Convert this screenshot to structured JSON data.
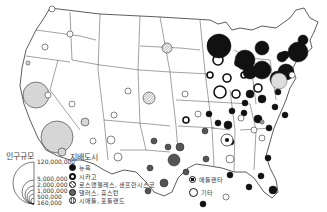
{
  "map": {
    "land_color": "#ffffff",
    "border_color": "#333333",
    "cities": [
      {
        "x": 167,
        "y": 48,
        "r": 5,
        "type": "seattle_portland"
      },
      {
        "x": 149,
        "y": 98,
        "r": 6,
        "type": "seattle_portland"
      },
      {
        "x": 52,
        "y": 9,
        "r": 3,
        "type": "other"
      },
      {
        "x": 45,
        "y": 47,
        "r": 3,
        "type": "other"
      },
      {
        "x": 70,
        "y": 34,
        "r": 3,
        "type": "other"
      },
      {
        "x": 28,
        "y": 63,
        "r": 2,
        "type": "seattle_portland"
      },
      {
        "x": 36,
        "y": 95,
        "r": 13,
        "type": "la_sf"
      },
      {
        "x": 57,
        "y": 137,
        "r": 16,
        "type": "la_sf"
      },
      {
        "x": 62,
        "y": 152,
        "r": 4,
        "type": "la_sf"
      },
      {
        "x": 48,
        "y": 95,
        "r": 3,
        "type": "other"
      },
      {
        "x": 72,
        "y": 104,
        "r": 3,
        "type": "other"
      },
      {
        "x": 85,
        "y": 122,
        "r": 4,
        "type": "la_sf"
      },
      {
        "x": 93,
        "y": 141,
        "r": 3,
        "type": "other"
      },
      {
        "x": 128,
        "y": 91,
        "r": 3,
        "type": "other"
      },
      {
        "x": 114,
        "y": 115,
        "r": 3,
        "type": "other"
      },
      {
        "x": 111,
        "y": 140,
        "r": 4,
        "type": "other"
      },
      {
        "x": 118,
        "y": 157,
        "r": 4,
        "type": "other"
      },
      {
        "x": 185,
        "y": 94,
        "r": 3,
        "type": "other"
      },
      {
        "x": 186,
        "y": 120,
        "r": 3,
        "type": "chicago"
      },
      {
        "x": 198,
        "y": 114,
        "r": 3,
        "type": "other"
      },
      {
        "x": 214,
        "y": 44,
        "r": 6,
        "type": "chicago"
      },
      {
        "x": 220,
        "y": 92,
        "r": 6,
        "type": "chicago"
      },
      {
        "x": 236,
        "y": 94,
        "r": 4,
        "type": "chicago"
      },
      {
        "x": 258,
        "y": 88,
        "r": 4,
        "type": "chicago"
      },
      {
        "x": 227,
        "y": 78,
        "r": 4,
        "type": "chicago"
      },
      {
        "x": 210,
        "y": 75,
        "r": 3,
        "type": "chicago"
      },
      {
        "x": 244,
        "y": 75,
        "r": 3,
        "type": "chicago"
      },
      {
        "x": 218,
        "y": 60,
        "r": 5,
        "type": "chicago"
      },
      {
        "x": 238,
        "y": 63,
        "r": 3,
        "type": "chicago"
      },
      {
        "x": 219,
        "y": 46,
        "r": 12,
        "type": "new_york"
      },
      {
        "x": 245,
        "y": 60,
        "r": 10,
        "type": "new_york"
      },
      {
        "x": 262,
        "y": 70,
        "r": 9,
        "type": "new_york"
      },
      {
        "x": 250,
        "y": 72,
        "r": 7,
        "type": "new_york"
      },
      {
        "x": 262,
        "y": 48,
        "r": 7,
        "type": "new_york"
      },
      {
        "x": 282,
        "y": 57,
        "r": 5,
        "type": "new_york"
      },
      {
        "x": 298,
        "y": 52,
        "r": 10,
        "type": "new_york"
      },
      {
        "x": 303,
        "y": 40,
        "r": 5,
        "type": "new_york"
      },
      {
        "x": 286,
        "y": 72,
        "r": 8,
        "type": "new_york"
      },
      {
        "x": 285,
        "y": 55,
        "r": 4,
        "type": "new_york"
      },
      {
        "x": 278,
        "y": 79,
        "r": 8,
        "type": "new_york"
      },
      {
        "x": 279,
        "y": 81,
        "r": 8,
        "type": "la_sf_light"
      },
      {
        "x": 292,
        "y": 75,
        "r": 3,
        "type": "other"
      },
      {
        "x": 278,
        "y": 92,
        "r": 3,
        "type": "new_york"
      },
      {
        "x": 262,
        "y": 99,
        "r": 4,
        "type": "new_york"
      },
      {
        "x": 250,
        "y": 94,
        "r": 4,
        "type": "new_york"
      },
      {
        "x": 245,
        "y": 103,
        "r": 3,
        "type": "new_york"
      },
      {
        "x": 232,
        "y": 111,
        "r": 3,
        "type": "new_york"
      },
      {
        "x": 231,
        "y": 142,
        "r": 3,
        "type": "new_york"
      },
      {
        "x": 218,
        "y": 123,
        "r": 3,
        "type": "new_york"
      },
      {
        "x": 209,
        "y": 114,
        "r": 3,
        "type": "new_york"
      },
      {
        "x": 244,
        "y": 113,
        "r": 3,
        "type": "new_york"
      },
      {
        "x": 258,
        "y": 119,
        "r": 4,
        "type": "new_york"
      },
      {
        "x": 228,
        "y": 125,
        "r": 4,
        "type": "new_york"
      },
      {
        "x": 254,
        "y": 130,
        "r": 3,
        "type": "other"
      },
      {
        "x": 262,
        "y": 122,
        "r": 2,
        "type": "atlanta"
      },
      {
        "x": 269,
        "y": 128,
        "r": 3,
        "type": "new_york"
      },
      {
        "x": 285,
        "y": 115,
        "r": 3,
        "type": "new_york"
      },
      {
        "x": 275,
        "y": 107,
        "r": 3,
        "type": "new_york"
      },
      {
        "x": 241,
        "y": 118,
        "r": 3,
        "type": "other"
      },
      {
        "x": 227,
        "y": 140,
        "r": 6,
        "type": "atlanta"
      },
      {
        "x": 230,
        "y": 159,
        "r": 4,
        "type": "other"
      },
      {
        "x": 268,
        "y": 158,
        "r": 3,
        "type": "new_york"
      },
      {
        "x": 273,
        "y": 190,
        "r": 4,
        "type": "new_york"
      },
      {
        "x": 262,
        "y": 138,
        "r": 3,
        "type": "other"
      },
      {
        "x": 205,
        "y": 131,
        "r": 3,
        "type": "dallas_houston"
      },
      {
        "x": 230,
        "y": 175,
        "r": 3,
        "type": "new_york"
      },
      {
        "x": 249,
        "y": 187,
        "r": 3,
        "type": "new_york"
      },
      {
        "x": 261,
        "y": 176,
        "r": 3,
        "type": "new_york"
      },
      {
        "x": 154,
        "y": 141,
        "r": 3,
        "type": "dallas_houston"
      },
      {
        "x": 168,
        "y": 147,
        "r": 3,
        "type": "dallas_houston"
      },
      {
        "x": 180,
        "y": 147,
        "r": 4,
        "type": "dallas_houston"
      },
      {
        "x": 174,
        "y": 160,
        "r": 6,
        "type": "dallas_houston"
      },
      {
        "x": 150,
        "y": 168,
        "r": 3,
        "type": "dallas_houston"
      },
      {
        "x": 164,
        "y": 183,
        "r": 4,
        "type": "dallas_houston"
      },
      {
        "x": 206,
        "y": 159,
        "r": 3,
        "type": "dallas_houston"
      },
      {
        "x": 148,
        "y": 191,
        "r": 3,
        "type": "dallas_houston"
      },
      {
        "x": 186,
        "y": 172,
        "r": 3,
        "type": "dallas_houston"
      },
      {
        "x": 203,
        "y": 204,
        "r": 3,
        "type": "new_york"
      },
      {
        "x": 226,
        "y": 197,
        "r": 3,
        "type": "other"
      }
    ]
  },
  "legend": {
    "size_title": "인구규모",
    "size_values": [
      "120,000,000",
      "5,000,000",
      "2,000,000",
      "1,000,000",
      "500,000",
      "160,000"
    ],
    "dominant_title": "지배도시",
    "dominant_items": [
      {
        "key": "new_york",
        "label": "뉴욕"
      },
      {
        "key": "chicago",
        "label": "시카고"
      },
      {
        "key": "la_sf",
        "label": "로스앤젤레스, 샌프란시스코"
      },
      {
        "key": "dallas_houston",
        "label": "댈러스, 휴스턴"
      },
      {
        "key": "seattle_portland",
        "label": "시애틀, 포틀랜드"
      }
    ],
    "extra_items": [
      {
        "key": "atlanta",
        "label": "애틀랜타"
      },
      {
        "key": "other",
        "label": "기타"
      }
    ]
  }
}
